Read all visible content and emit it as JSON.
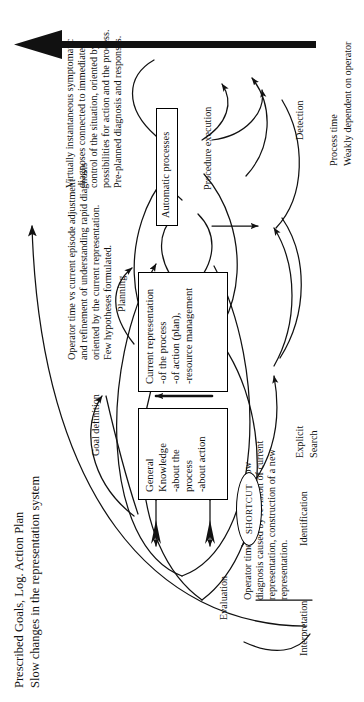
{
  "figure": {
    "type": "cognitive-control-diagram",
    "title_line1": "Prescribed Goals, Log. Action Plan",
    "title_line2": "Slow changes in the representation system",
    "axis_label_line1": "Process time",
    "axis_label_line2": "Weakly dependent on operator"
  },
  "boxes": {
    "general_knowledge": {
      "title": "General Knowledge",
      "item1": "-about the process",
      "item2": "-about action"
    },
    "current_representation": {
      "title": "Current representation",
      "item1": "-of the process",
      "item2": "-of action (plan),",
      "item3": "-resource management"
    },
    "automatic_processes": {
      "title": "Automatic processes"
    }
  },
  "nodes": {
    "interpretation": "Interpretation",
    "identification": "Identification",
    "shortcut": "SHORTCUT",
    "explicit_search_line1": "Explicit",
    "explicit_search_line2": "Search",
    "evaluation": "Evaluation",
    "goal_definition": "Goal definition",
    "planning": "Planning",
    "detection": "Detection",
    "procedure_execution": "Procedure execution"
  },
  "annotations": {
    "slow_loop": {
      "line1": "Operator time vs Task Time: slow",
      "line2": "diagnosis caused by revision of current",
      "line3": "representation, construction of a new",
      "line4": "representation."
    },
    "mid_loop": {
      "line1": "Operator time vs current episode adjustment",
      "line2": "and refinement of understanding rapid diagnosis",
      "line3": "oriented by the current representation.",
      "line4": "Few hypotheses formulated."
    },
    "fast_loop": {
      "line1": "Virtually instantaneous symptomatic",
      "line2": "diagnoses connected to immediate",
      "line3": "control of the situation, oriented by",
      "line4": "possibilities for action and the process.",
      "line5": "Pre-planned diagnosis and responses."
    }
  },
  "colors": {
    "ink": "#111111",
    "paper": "#ffffff"
  }
}
